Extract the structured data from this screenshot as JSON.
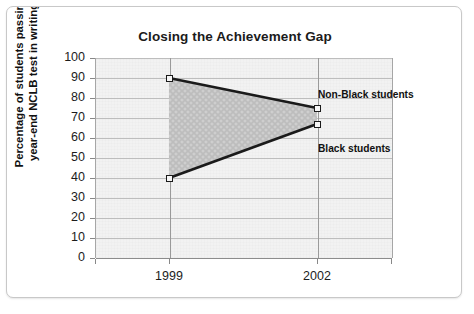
{
  "chart_data": {
    "type": "line",
    "title": "Closing the Achievement Gap",
    "xlabel": "",
    "ylabel": "Percentage of students passing\nyear-end NCLB test in writing",
    "categories": [
      "1999",
      "2002"
    ],
    "x_tick_labels": [
      "1999",
      "2002"
    ],
    "y_tick_labels": [
      "100",
      "90",
      "80",
      "70",
      "60",
      "50",
      "40",
      "30",
      "20",
      "10",
      "0"
    ],
    "ylim": [
      0,
      100
    ],
    "y_tick_step": 10,
    "grid": "horizontal",
    "legend_position": "inline-annotations",
    "shaded_gap_region": true,
    "series": [
      {
        "name": "Non-Black students",
        "values": [
          90,
          75
        ],
        "marker": "square",
        "color": "#1a1a1a"
      },
      {
        "name": "Black students",
        "values": [
          40,
          67
        ],
        "marker": "square",
        "color": "#1a1a1a"
      }
    ],
    "annotations": [
      {
        "text": "Non-Black students",
        "near_series": "Non-Black students"
      },
      {
        "text": "Black students",
        "near_series": "Black students"
      }
    ]
  },
  "figure": {
    "title": "Closing the Achievement Gap",
    "y_axis_title": "Percentage of students passing\nyear-end NCLB test in writing",
    "ticks": {
      "y": [
        "100",
        "90",
        "80",
        "70",
        "60",
        "50",
        "40",
        "30",
        "20",
        "10",
        "0"
      ],
      "x": [
        "1999",
        "2002"
      ]
    },
    "labels": {
      "non_black": "Non-Black students",
      "black": "Black students"
    },
    "colors": {
      "plot_background": "#f2f2f2",
      "gridline": "#bdbdbd",
      "series_line": "#1a1a1a",
      "fill_region": "#c9c9c9",
      "frame_border": "#c8c8c8"
    }
  }
}
